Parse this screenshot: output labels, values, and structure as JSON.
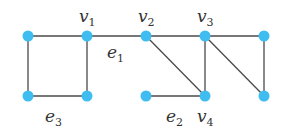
{
  "diagram": {
    "type": "graph",
    "colors": {
      "node": "#3fbdf0",
      "edge": "#4a4a4a",
      "label": "#333333"
    },
    "nodes": [
      {
        "id": "a",
        "label": ""
      },
      {
        "id": "v1",
        "label": "v",
        "sub": "1"
      },
      {
        "id": "v2",
        "label": "v",
        "sub": "2"
      },
      {
        "id": "v3",
        "label": "v",
        "sub": "3"
      },
      {
        "id": "r",
        "label": ""
      },
      {
        "id": "b",
        "label": ""
      },
      {
        "id": "c",
        "label": ""
      },
      {
        "id": "d",
        "label": ""
      },
      {
        "id": "v4",
        "label": "v",
        "sub": "4"
      },
      {
        "id": "e",
        "label": ""
      }
    ],
    "edges": [
      {
        "from": "a",
        "to": "v1",
        "label": ""
      },
      {
        "from": "a",
        "to": "b",
        "label": ""
      },
      {
        "from": "b",
        "to": "c",
        "label": "e",
        "sub": "3"
      },
      {
        "from": "v1",
        "to": "c",
        "label": ""
      },
      {
        "from": "v1",
        "to": "v2",
        "label": "e",
        "sub": "1"
      },
      {
        "from": "v2",
        "to": "v3",
        "label": ""
      },
      {
        "from": "v3",
        "to": "r",
        "label": ""
      },
      {
        "from": "v2",
        "to": "v4",
        "label": ""
      },
      {
        "from": "v3",
        "to": "v4",
        "label": ""
      },
      {
        "from": "v3",
        "to": "e",
        "label": ""
      },
      {
        "from": "r",
        "to": "e",
        "label": ""
      },
      {
        "from": "d",
        "to": "v4",
        "label": "e",
        "sub": "2"
      }
    ]
  }
}
